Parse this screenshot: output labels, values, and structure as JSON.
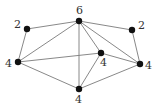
{
  "diagram": {
    "type": "graph",
    "nodes": [
      {
        "id": "top",
        "label": "6",
        "x": 79,
        "y": 21,
        "lx": 76,
        "ly": 14
      },
      {
        "id": "upper-left",
        "label": "2",
        "x": 27,
        "y": 29,
        "lx": 14,
        "ly": 28
      },
      {
        "id": "upper-right",
        "label": "2",
        "x": 132,
        "y": 30,
        "lx": 138,
        "ly": 29
      },
      {
        "id": "left",
        "label": "4",
        "x": 18,
        "y": 62,
        "lx": 5,
        "ly": 67
      },
      {
        "id": "inner",
        "label": "4",
        "x": 101,
        "y": 53,
        "lx": 100,
        "ly": 66
      },
      {
        "id": "right",
        "label": "4",
        "x": 140,
        "y": 64,
        "lx": 145,
        "ly": 69
      },
      {
        "id": "bottom",
        "label": "4",
        "x": 79,
        "y": 89,
        "lx": 75,
        "ly": 103
      }
    ],
    "edges": [
      [
        "upper-left",
        "top"
      ],
      [
        "upper-left",
        "left"
      ],
      [
        "top",
        "upper-right"
      ],
      [
        "upper-right",
        "right"
      ],
      [
        "top",
        "left"
      ],
      [
        "top",
        "bottom"
      ],
      [
        "top",
        "inner"
      ],
      [
        "top",
        "right"
      ],
      [
        "left",
        "inner"
      ],
      [
        "left",
        "bottom"
      ],
      [
        "inner",
        "bottom"
      ],
      [
        "inner",
        "right"
      ],
      [
        "bottom",
        "right"
      ]
    ]
  }
}
